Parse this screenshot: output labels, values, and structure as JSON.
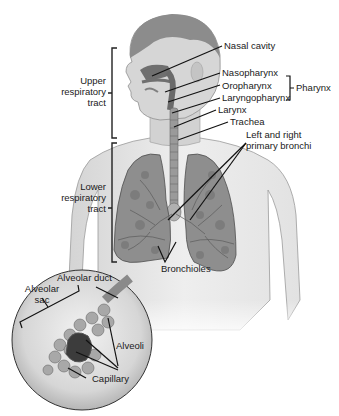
{
  "diagram": {
    "colors": {
      "background": "#ffffff",
      "skin": "#d9d9d9",
      "skin_shadow": "#b5b5b5",
      "hair": "#8a8a8a",
      "airway": "#7a7a7a",
      "lung": "#8e8e8e",
      "lung_dark": "#5f5f5f",
      "line": "#111111",
      "text": "#1a1a1a"
    },
    "labels": {
      "nasal_cavity": "Nasal cavity",
      "nasopharynx": "Nasopharynx",
      "oropharynx": "Oropharynx",
      "laryngopharynx": "Laryngopharynx",
      "pharynx": "Pharynx",
      "larynx": "Larynx",
      "trachea": "Trachea",
      "primary_bronchi_line1": "Left and right",
      "primary_bronchi_line2": "primary bronchi",
      "upper_tract_line1": "Upper",
      "upper_tract_line2": "respiratory",
      "upper_tract_line3": "tract",
      "lower_tract_line1": "Lower",
      "lower_tract_line2": "respiratory",
      "lower_tract_line3": "tract",
      "bronchioles": "Bronchioles",
      "alveolar_duct": "Alveolar duct",
      "alveolar_sac_line1": "Alveolar",
      "alveolar_sac_line2": "sac",
      "alveoli": "Alveoli",
      "capillary": "Capillary"
    }
  }
}
